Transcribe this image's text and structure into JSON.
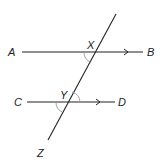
{
  "diagram": {
    "labels": {
      "A": "A",
      "B": "B",
      "C": "C",
      "D": "D",
      "X": "X",
      "Y": "Y",
      "Z": "Z"
    },
    "colors": {
      "line": "#222222",
      "angle_arc": "#999999",
      "background": "#ffffff"
    }
  }
}
